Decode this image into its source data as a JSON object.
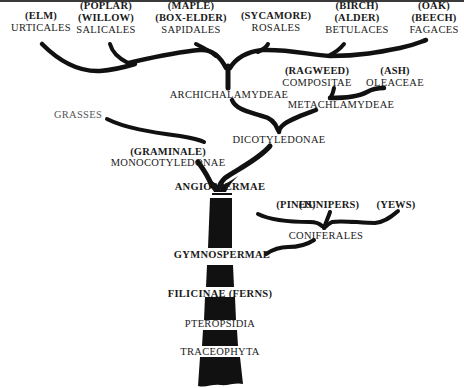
{
  "diagram": {
    "type": "phylogenetic-tree",
    "trunk_labels": [
      {
        "id": "angiospermae",
        "text": "ANGIOSPERMAE"
      },
      {
        "id": "gymnospermae",
        "text": "GYMNOSPERMAE"
      },
      {
        "id": "filicinae",
        "text": "FILICINAE (FERNS)"
      },
      {
        "id": "pteropsidia",
        "text": "PTEROPSIDIA"
      },
      {
        "id": "traceophyta",
        "text": "TRACEOPHYTA"
      }
    ],
    "leaves": [
      {
        "id": "urticales",
        "common": [
          "(ELM)"
        ],
        "order": "URTICALES"
      },
      {
        "id": "salicales",
        "common": [
          "(POPLAR)",
          "(WILLOW)"
        ],
        "order": "SALICALES"
      },
      {
        "id": "sapidales",
        "common": [
          "(MAPLE)",
          "(BOX-ELDER)"
        ],
        "order": "SAPIDALES"
      },
      {
        "id": "rosales",
        "common": [
          "(SYCAMORE)"
        ],
        "order": "ROSALES"
      },
      {
        "id": "betulaces",
        "common": [
          "(BIRCH)",
          "(ALDER)"
        ],
        "order": "BETULACES"
      },
      {
        "id": "fagaces",
        "common": [
          "(OAK)",
          "(BEECH)"
        ],
        "order": "FAGACES"
      },
      {
        "id": "compositae",
        "common": [
          "(RAGWEED)"
        ],
        "order": "COMPOSITAE"
      },
      {
        "id": "oleaceae",
        "common": [
          "(ASH)"
        ],
        "order": "OLEACEAE"
      }
    ],
    "internal_nodes": {
      "archichalamydeae": "ARCHICHALAMYDEAE",
      "metachlamydeae": "METACHLAMYDEAE",
      "dicotyledonae": "DICOTYLEDONAE",
      "grasses": "GRASSES",
      "graminale": "(GRAMINALE)",
      "monocotyledonae": "MONOCOTYLEDONAE",
      "coniferales": "CONIFERALES",
      "pines": "(PINES)",
      "junipers": "(JUNIPERS)",
      "yews": "(YEWS)"
    },
    "colors": {
      "ink": "#111111",
      "background": "#ffffff",
      "faded_label": "#555555"
    }
  }
}
